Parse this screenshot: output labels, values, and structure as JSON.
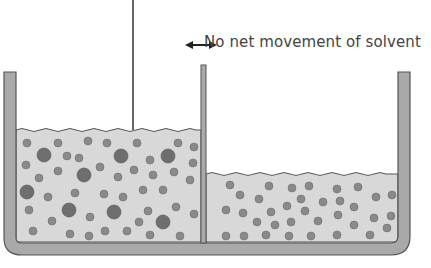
{
  "annotation": {
    "text": "No net movement of solvent",
    "icon": "double-headed-arrow-icon"
  },
  "colors": {
    "container_fill": "#a9a9a9",
    "container_stroke": "#555555",
    "liquid_fill": "#d8d8d8",
    "particle_small": "#8a8a8a",
    "particle_large": "#6e6e6e",
    "membrane": "#888888",
    "text": "#444444"
  },
  "diagram": {
    "left_compartment": {
      "description": "Higher liquid level with large solute particles and small solvent particles",
      "particles": "small and large"
    },
    "right_compartment": {
      "description": "Lower liquid level with only small solvent particles",
      "particles": "small"
    },
    "membrane": "semi-permeable membrane",
    "piston_rod": "vertical line pressing on left compartment"
  }
}
